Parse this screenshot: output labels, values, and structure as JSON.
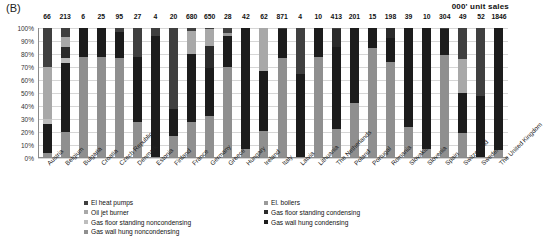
{
  "panel": {
    "label": "(B)"
  },
  "unit_note": "000' unit sales",
  "chart_data": {
    "type": "bar",
    "subtype": "stacked-percent",
    "title": "",
    "xlabel": "",
    "ylabel": "Share of unit sales",
    "ylim": [
      0,
      100
    ],
    "yticks": [
      "0%",
      "10%",
      "20%",
      "30%",
      "40%",
      "50%",
      "60%",
      "70%",
      "80%",
      "90%",
      "100%"
    ],
    "grid": true,
    "legend_position": "bottom",
    "top_label_title": "000' unit sales",
    "categories": [
      "Austria",
      "Belgium",
      "Bulgaria",
      "Croatia",
      "Czech Republic",
      "Denmark",
      "Estonia",
      "Finland",
      "France",
      "Germany",
      "Greece",
      "Hungary",
      "Ireland",
      "Italy",
      "Latvia",
      "Lithuania",
      "The Netherlands",
      "Poland",
      "Portugal",
      "Romania",
      "Slovakia",
      "Slovenia",
      "Spain",
      "Switzerland",
      "Sweden",
      "The United Kingdom"
    ],
    "top_labels": [
      "66",
      "213",
      "6",
      "25",
      "95",
      "27",
      "4",
      "20",
      "680",
      "650",
      "28",
      "42",
      "62",
      "871",
      "4",
      "10",
      "413",
      "201",
      "15",
      "198",
      "39",
      "10",
      "304",
      "49",
      "52",
      "1846"
    ],
    "series": [
      {
        "name": "El heat pumps",
        "color": "#3f3f3f",
        "values": [
          30,
          7,
          0,
          0,
          3,
          22,
          6,
          62,
          2,
          1,
          4,
          0,
          0,
          1,
          35,
          0,
          1,
          0,
          0,
          0,
          0,
          0,
          1,
          24,
          52,
          0
        ]
      },
      {
        "name": "El. boilers",
        "color": "#9a9a9a",
        "values": [
          0,
          0,
          0,
          0,
          0,
          0,
          0,
          0,
          0,
          0,
          2,
          0,
          0,
          0,
          0,
          0,
          0,
          0,
          0,
          0,
          0,
          0,
          0,
          0,
          0,
          0
        ]
      },
      {
        "name": "Oil jet burner",
        "color": "#a8a8a8",
        "values": [
          40,
          8,
          0,
          0,
          0,
          0,
          0,
          0,
          18,
          13,
          0,
          0,
          33,
          0,
          0,
          0,
          0,
          0,
          0,
          0,
          0,
          0,
          0,
          26,
          0,
          0
        ]
      },
      {
        "name": "Gas floor standing condensing",
        "color": "#2b2b2b",
        "values": [
          0,
          8,
          0,
          0,
          0,
          0,
          0,
          0,
          0,
          17,
          0,
          0,
          0,
          0,
          0,
          0,
          14,
          0,
          0,
          8,
          0,
          0,
          0,
          0,
          0,
          0
        ]
      },
      {
        "name": "Gas floor standing noncondensing",
        "color": "#bdbdbd",
        "values": [
          4,
          4,
          0,
          0,
          0,
          0,
          0,
          0,
          0,
          0,
          0,
          0,
          0,
          0,
          0,
          0,
          0,
          0,
          0,
          0,
          0,
          0,
          0,
          0,
          0,
          0
        ]
      },
      {
        "name": "Gas wall hung condensing",
        "color": "#1c1c1c",
        "values": [
          22,
          53,
          22,
          22,
          20,
          50,
          94,
          21,
          52,
          37,
          24,
          93,
          46,
          22,
          65,
          22,
          63,
          58,
          15,
          18,
          76,
          93,
          20,
          31,
          48,
          94
        ]
      },
      {
        "name": "Gas wall hung noncondensing",
        "color": "#8f8f8f",
        "values": [
          4,
          20,
          78,
          78,
          77,
          28,
          0,
          17,
          28,
          32,
          70,
          7,
          21,
          77,
          0,
          78,
          22,
          42,
          85,
          74,
          24,
          7,
          79,
          19,
          0,
          6
        ]
      }
    ],
    "legend_left": [
      "El heat pumps",
      "Oil jet burner",
      "Gas floor standing noncondensing",
      "Gas wall hung noncondensing"
    ],
    "legend_right": [
      "El. boilers",
      "Gas floor standing condensing",
      "Gas wall hung condensing"
    ]
  }
}
